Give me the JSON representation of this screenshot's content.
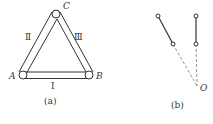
{
  "figure_a": {
    "caption": "(a)",
    "vertices": {
      "A": "A",
      "B": "B",
      "C": "C"
    },
    "rods": {
      "I": "Ⅰ",
      "II": "Ⅱ",
      "III": "Ⅲ"
    }
  },
  "figure_b": {
    "caption": "(b)",
    "point": "O"
  },
  "colors": {
    "line": "#333333",
    "dashed": "#777777",
    "background": "#ffffff"
  }
}
